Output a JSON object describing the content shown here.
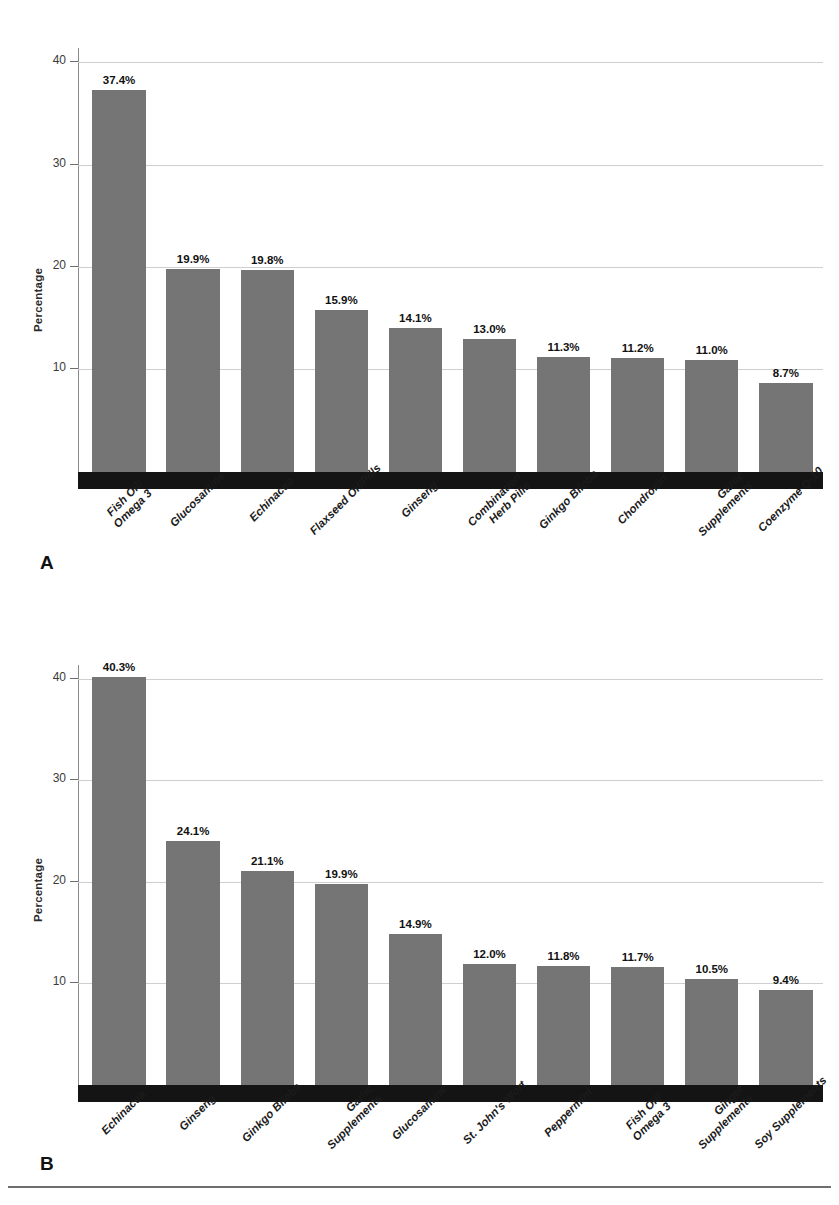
{
  "figure": {
    "bottom_rule": true,
    "bar_color": "#757575",
    "baseline_color": "#141414",
    "gridline_color": "#cfcfcf"
  },
  "chart_data": [
    {
      "type": "bar",
      "panel": "A",
      "title": "",
      "xlabel": "",
      "ylabel": "Percentage",
      "ylim": [
        0,
        41.5
      ],
      "yticks": [
        10,
        20,
        30,
        40
      ],
      "ytick_labels": [
        "10",
        "20",
        "30",
        "40"
      ],
      "grid": true,
      "legend": "none",
      "categories": [
        "Fish Oil/\nOmega 3",
        "Glucosamine",
        "Echinacea",
        "Flaxseed Oil/Pills",
        "Ginseng",
        "Combination\nHerb Pills",
        "Ginkgo Biloba",
        "Chondroitin",
        "Garlic\nSupplements",
        "Coenzyme Q-10"
      ],
      "values": [
        37.4,
        19.9,
        19.8,
        15.9,
        14.1,
        13.0,
        11.3,
        11.2,
        11.0,
        8.7
      ],
      "value_labels": [
        "37.4%",
        "19.9%",
        "19.8%",
        "15.9%",
        "14.1%",
        "13.0%",
        "11.3%",
        "11.2%",
        "11.0%",
        "8.7%"
      ]
    },
    {
      "type": "bar",
      "panel": "B",
      "title": "",
      "xlabel": "",
      "ylabel": "Percentage",
      "ylim": [
        0,
        41.5
      ],
      "yticks": [
        10,
        20,
        30,
        40
      ],
      "ytick_labels": [
        "10",
        "20",
        "30",
        "40"
      ],
      "grid": true,
      "legend": "none",
      "categories": [
        "Echinacea",
        "Ginseng",
        "Ginkgo Biloba",
        "Garlic\nSupplements",
        "Glucosamine",
        "St. John's Wort",
        "Peppermint",
        "Fish Oil/\nOmega 3",
        "Ginger\nSupplements",
        "Soy Supplements"
      ],
      "values": [
        40.3,
        24.1,
        21.1,
        19.9,
        14.9,
        12.0,
        11.8,
        11.7,
        10.5,
        9.4
      ],
      "value_labels": [
        "40.3%",
        "24.1%",
        "21.1%",
        "19.9%",
        "14.9%",
        "12.0%",
        "11.8%",
        "11.7%",
        "10.5%",
        "9.4%"
      ]
    }
  ],
  "panels": {
    "a": {
      "letter": "A",
      "ylabel": "Percentage"
    },
    "b": {
      "letter": "B",
      "ylabel": "Percentage"
    }
  }
}
